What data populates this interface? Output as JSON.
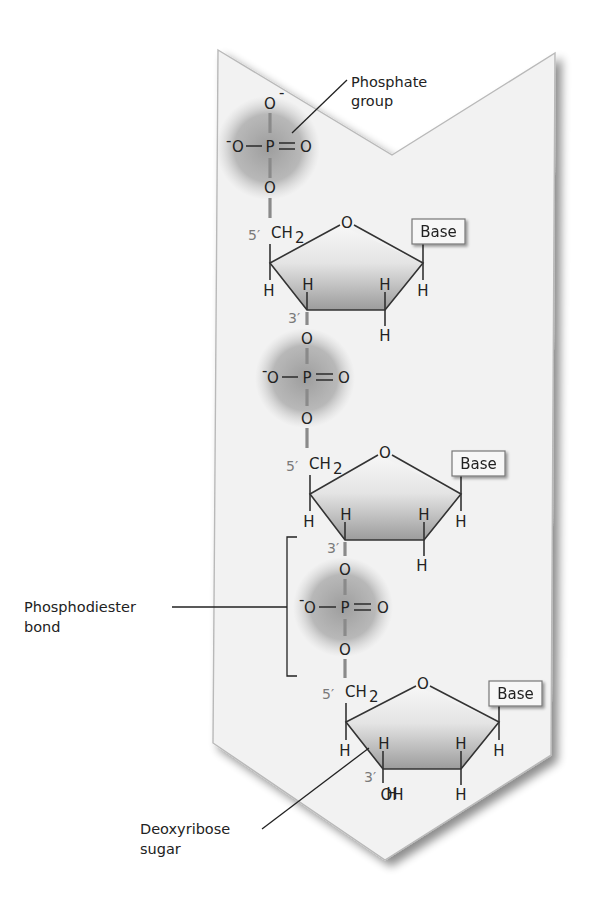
{
  "figure": {
    "colors": {
      "background": "#ffffff",
      "chevron_fill": "#f2f2f2",
      "chevron_edge": "#b9b9b9",
      "phosphate_halo": "#9a9a9a",
      "sugar_fill_dark": "#9c9c9c",
      "sugar_fill_light": "#f5f5f5",
      "bond": "#333333",
      "backbone_bond": "#8a8a8a",
      "prime_label": "#7a7a7a",
      "text": "#222222"
    }
  },
  "labels": {
    "phosphate_group": [
      "Phosphate",
      "group"
    ],
    "phosphodiester_bond": [
      "Phosphodiester",
      "bond"
    ],
    "deoxyribose_sugar": [
      "Deoxyribose",
      "sugar"
    ]
  },
  "atoms": {
    "oxygen": "O",
    "oxygen_neg": "O",
    "neg_sign": "-",
    "phosphorus": "P",
    "hydrogen": "H",
    "ch2": "CH",
    "ch2_sub": "2",
    "hydroxyl": "OH",
    "five_prime": "5′",
    "three_prime": "3′",
    "base": "Base"
  },
  "nucleotides": [
    {
      "index": 1,
      "base": "Base",
      "terminal_phosphate": true
    },
    {
      "index": 2,
      "base": "Base"
    },
    {
      "index": 3,
      "base": "Base",
      "three_prime_end": "OH"
    }
  ]
}
